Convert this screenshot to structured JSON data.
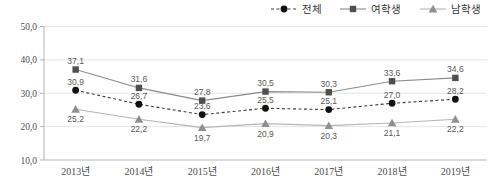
{
  "chart_data": {
    "type": "line",
    "categories": [
      "2013년",
      "2014년",
      "2015년",
      "2016년",
      "2017년",
      "2018년",
      "2019년"
    ],
    "series": [
      {
        "name": "전체",
        "values": [
          30.9,
          26.7,
          23.6,
          25.5,
          25.1,
          27.0,
          28.2
        ],
        "labels": [
          "30,9",
          "26,7",
          "23,6",
          "25,5",
          "25,1",
          "27,0",
          "28,2"
        ],
        "marker": "circle",
        "line_style": "dashed",
        "line_color": "#3d3d3d",
        "marker_color": "#111111",
        "label_position": "above"
      },
      {
        "name": "여학생",
        "values": [
          37.1,
          31.6,
          27.8,
          30.5,
          30.3,
          33.6,
          34.6
        ],
        "labels": [
          "37,1",
          "31,6",
          "27,8",
          "30,5",
          "30,3",
          "33,6",
          "34,6"
        ],
        "marker": "square",
        "line_style": "solid",
        "line_color": "#8a8a8a",
        "marker_color": "#4f4f4f",
        "label_position": "above"
      },
      {
        "name": "남학생",
        "values": [
          25.2,
          22.2,
          19.7,
          20.9,
          20.3,
          21.1,
          22.2
        ],
        "labels": [
          "25,2",
          "22,2",
          "19,7",
          "20,9",
          "20,3",
          "21,1",
          "22,2"
        ],
        "marker": "triangle",
        "line_style": "solid",
        "line_color": "#b5b5b5",
        "marker_color": "#8f8f8f",
        "label_position": "below"
      }
    ],
    "ylim": [
      10,
      50
    ],
    "ytick_step": 10,
    "ytick_labels": [
      "10,0",
      "20,0",
      "30,0",
      "40,0",
      "50,0"
    ],
    "decimal_separator": ",",
    "grid": "horizontal",
    "legend_position": "top-right",
    "colors": {
      "grid": "#e4e4e4",
      "axis": "#b3b3b3",
      "tick_text": "#4d4d4d",
      "data_label_text": "#595959",
      "legend_text": "#333333",
      "background": "#ffffff"
    }
  }
}
